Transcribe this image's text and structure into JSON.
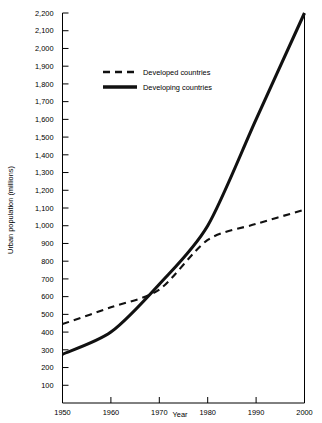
{
  "chart_data": {
    "type": "line",
    "title": "",
    "xlabel": "Year",
    "ylabel": "Urban population (millions)",
    "x": [
      1950,
      1960,
      1970,
      1980,
      1990,
      2000
    ],
    "xlim": [
      1950,
      2000
    ],
    "ylim": [
      0,
      2200
    ],
    "grid": false,
    "legend_position": "upper-left-inside",
    "xticks": [
      "1950",
      "1960",
      "1970",
      "1980",
      "1990",
      "2000"
    ],
    "yticks": [
      "100",
      "200",
      "300",
      "400",
      "500",
      "600",
      "700",
      "800",
      "900",
      "1,000",
      "1,100",
      "1,200",
      "1,300",
      "1,400",
      "1,500",
      "1,600",
      "1,700",
      "1,800",
      "1,900",
      "2,000",
      "2,100",
      "2,200"
    ],
    "ytick_values": [
      100,
      200,
      300,
      400,
      500,
      600,
      700,
      800,
      900,
      1000,
      1100,
      1200,
      1300,
      1400,
      1500,
      1600,
      1700,
      1800,
      1900,
      2000,
      2100,
      2200
    ],
    "series": [
      {
        "name": "Developed countries",
        "style": "dashed",
        "color": "#111111",
        "values": [
          445,
          540,
          640,
          920,
          1010,
          1090
        ]
      },
      {
        "name": "Developing countries",
        "style": "solid",
        "color": "#111111",
        "values": [
          275,
          400,
          670,
          1000,
          1600,
          2200
        ]
      }
    ],
    "annotations": {
      "crossover_year": 1972,
      "crossover_value": 700
    }
  },
  "legend": {
    "entries": [
      {
        "label": "Developed countries",
        "style": "dashed"
      },
      {
        "label": "Developing countries",
        "style": "solid"
      }
    ]
  },
  "axes": {
    "x_title": "Year",
    "y_title": "Urban population (millions)"
  }
}
